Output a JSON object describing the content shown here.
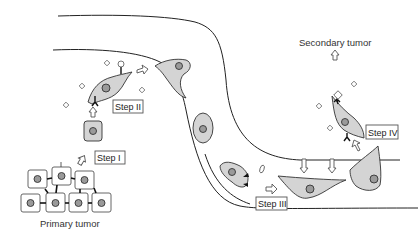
{
  "diagram": {
    "labels": {
      "primary_tumor": "Primary tumor",
      "secondary_tumor": "Secondary tumor"
    },
    "steps": [
      {
        "id": "step1",
        "label": "Step I"
      },
      {
        "id": "step2",
        "label": "Step II"
      },
      {
        "id": "step3",
        "label": "Step III"
      },
      {
        "id": "step4",
        "label": "Step IV"
      }
    ],
    "colors": {
      "cell_fill": "#d4d4d4",
      "nucleus_fill": "#9a9a9a",
      "line": "#222222",
      "background": "#ffffff"
    }
  }
}
